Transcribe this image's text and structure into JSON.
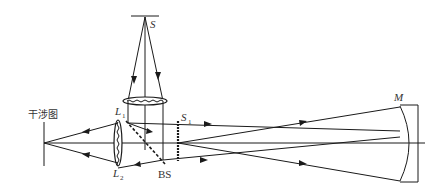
{
  "diagram": {
    "labels": {
      "source": "S",
      "lens1": "L",
      "lens1_sub": "1",
      "lens2": "L",
      "lens2_sub": "2",
      "slit": "S",
      "slit_sub": "1",
      "beam_splitter": "BS",
      "mirror": "M",
      "interferogram": "干涉图"
    },
    "line_color": "#1a1a1a",
    "label_color": "#333333"
  }
}
